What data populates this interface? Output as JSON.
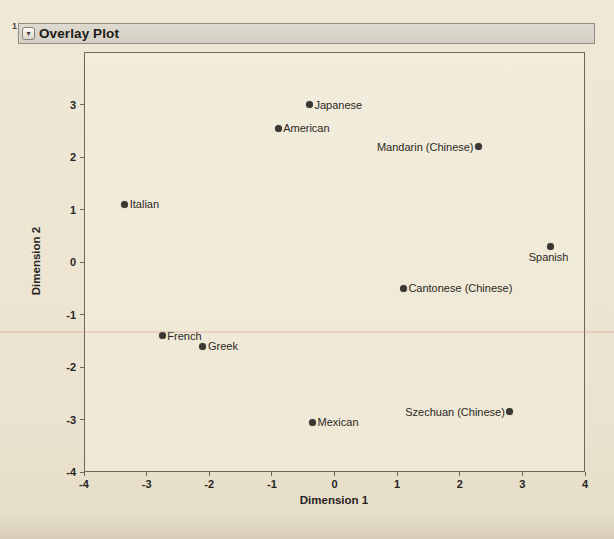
{
  "header": {
    "title": "Overlay Plot",
    "page_mark": "1",
    "disclosure_icon": "triangle-down"
  },
  "chart_data": {
    "type": "scatter",
    "title": "Overlay Plot",
    "xlabel": "Dimension 1",
    "ylabel": "Dimension 2",
    "xlim": [
      -4,
      4
    ],
    "ylim": [
      -4,
      4
    ],
    "x_ticks": [
      -4,
      -3,
      -2,
      -1,
      0,
      1,
      2,
      3,
      4
    ],
    "y_ticks": [
      -4,
      -3,
      -2,
      -1,
      0,
      1,
      2,
      3
    ],
    "grid": false,
    "legend": "none",
    "marker_color": "#3b3833",
    "points": [
      {
        "label": "Japanese",
        "x": -0.4,
        "y": 3.0,
        "label_side": "right"
      },
      {
        "label": "American",
        "x": -0.9,
        "y": 2.55,
        "label_side": "right"
      },
      {
        "label": "Mandarin (Chinese)",
        "x": 2.3,
        "y": 2.2,
        "label_side": "left"
      },
      {
        "label": "Italian",
        "x": -3.35,
        "y": 1.1,
        "label_side": "right"
      },
      {
        "label": "Spanish",
        "x": 3.45,
        "y": 0.3,
        "label_side": "below"
      },
      {
        "label": "Cantonese (Chinese)",
        "x": 1.1,
        "y": -0.5,
        "label_side": "right"
      },
      {
        "label": "French",
        "x": -2.75,
        "y": -1.4,
        "label_side": "right"
      },
      {
        "label": "Greek",
        "x": -2.1,
        "y": -1.6,
        "label_side": "right"
      },
      {
        "label": "Mexican",
        "x": -0.35,
        "y": -3.05,
        "label_side": "right"
      },
      {
        "label": "Szechuan (Chinese)",
        "x": 2.8,
        "y": -2.85,
        "label_side": "left"
      }
    ]
  },
  "colors": {
    "paper": "#ece4d1",
    "plot_background": "#f1ebdb",
    "titlebar_fill": "#d6d2c6",
    "titlebar_border": "#8f8c82",
    "axis_line": "#6a665b",
    "marker": "#3b3833",
    "text": "#27241f"
  }
}
